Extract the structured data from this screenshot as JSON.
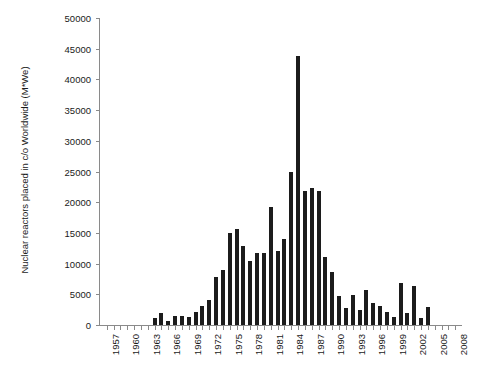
{
  "chart_data": {
    "type": "bar",
    "title": "",
    "subtitle": "",
    "xlabel": "",
    "ylabel": "Nuclear reactors placed in c/o Worldwide (M*We)",
    "ylim": [
      0,
      50000
    ],
    "ytick_values": [
      0,
      5000,
      10000,
      15000,
      20000,
      25000,
      30000,
      35000,
      40000,
      45000,
      50000
    ],
    "ytick_labels": [
      "0",
      "5000",
      "10000",
      "15000",
      "20000",
      "25000",
      "30000",
      "35000",
      "40000",
      "45000",
      "50000"
    ],
    "xtick_labels": [
      "1957",
      "1960",
      "1963",
      "1966",
      "1969",
      "1972",
      "1975",
      "1978",
      "1981",
      "1984",
      "1987",
      "1990",
      "1993",
      "1996",
      "1999",
      "2002",
      "2005",
      "2008"
    ],
    "xtick_step": 3,
    "grid": false,
    "legend": false,
    "legend_position": "none",
    "bar_color": "#1c1c1c",
    "axis_color": "#8a8a8a",
    "categories": [
      "1957",
      "1958",
      "1959",
      "1960",
      "1961",
      "1962",
      "1963",
      "1964",
      "1965",
      "1966",
      "1967",
      "1968",
      "1969",
      "1970",
      "1971",
      "1972",
      "1973",
      "1974",
      "1975",
      "1976",
      "1977",
      "1978",
      "1979",
      "1980",
      "1981",
      "1982",
      "1983",
      "1984",
      "1985",
      "1986",
      "1987",
      "1988",
      "1989",
      "1990",
      "1991",
      "1992",
      "1993",
      "1994",
      "1995",
      "1996",
      "1997",
      "1998",
      "1999",
      "2000",
      "2001",
      "2002",
      "2003",
      "2004",
      "2005",
      "2006",
      "2007",
      "2008"
    ],
    "values": [
      0,
      0,
      0,
      0,
      0,
      0,
      0,
      1200,
      1900,
      700,
      1400,
      1400,
      1300,
      2200,
      3100,
      4000,
      7900,
      9000,
      15000,
      15600,
      12800,
      10500,
      11800,
      11800,
      19200,
      12100,
      14000,
      24900,
      43800,
      21900,
      22300,
      21900,
      11000,
      8700,
      4800,
      2800,
      4900,
      2500,
      5700,
      3600,
      3100,
      2100,
      1300,
      6800,
      2000,
      6400,
      1100,
      3000,
      0,
      0,
      0,
      0
    ]
  }
}
